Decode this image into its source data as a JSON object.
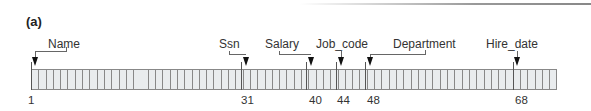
{
  "figure": {
    "label": "(a)",
    "record": {
      "total_cells": 72,
      "cell_color": "#e9ecee",
      "border_color": "#888888"
    },
    "fields": [
      {
        "name": "Name",
        "start": 1
      },
      {
        "name": "Ssn",
        "start": 31
      },
      {
        "name": "Salary",
        "start": 40
      },
      {
        "name": "Job_code",
        "start": 44
      },
      {
        "name": "Department",
        "start": 48
      },
      {
        "name": "Hire_date",
        "start": 68
      }
    ],
    "positions": [
      "1",
      "31",
      "40",
      "44",
      "48",
      "68"
    ]
  }
}
